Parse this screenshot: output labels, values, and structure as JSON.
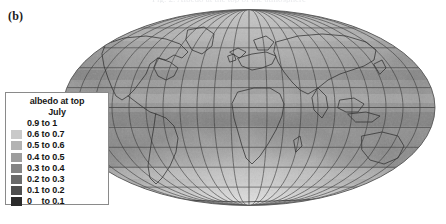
{
  "figure": {
    "panel_label": "(b)",
    "top_caption_sliver": "Fig. 2.  Albedo at the top of the atmosphere",
    "background_color": "#ffffff"
  },
  "legend": {
    "title": "albedo at top",
    "subtitle": "July",
    "border_color": "#8a8a8a",
    "background_color": "#ffffff",
    "entries": [
      {
        "label": "0.9 to 1",
        "color": "#ffffff",
        "has_swatch": false,
        "vmin": 0.9,
        "vmax": 1.0
      },
      {
        "label": "0.6 to 0.7",
        "color": "#c9c9c9",
        "has_swatch": true,
        "vmin": 0.6,
        "vmax": 0.7
      },
      {
        "label": "0.5 to 0.6",
        "color": "#b3b3b3",
        "has_swatch": true,
        "vmin": 0.5,
        "vmax": 0.6
      },
      {
        "label": "0.4 to 0.5",
        "color": "#9d9d9d",
        "has_swatch": true,
        "vmin": 0.4,
        "vmax": 0.5
      },
      {
        "label": "0.3 to 0.4",
        "color": "#848484",
        "has_swatch": true,
        "vmin": 0.3,
        "vmax": 0.4
      },
      {
        "label": "0.2 to 0.3",
        "color": "#6a6a6a",
        "has_swatch": true,
        "vmin": 0.2,
        "vmax": 0.3
      },
      {
        "label": "0.1 to 0.2",
        "color": "#4e4e4e",
        "has_swatch": true,
        "vmin": 0.1,
        "vmax": 0.2
      },
      {
        "label": "0    to 0.1",
        "color": "#2b2b2b",
        "has_swatch": true,
        "vmin": 0.0,
        "vmax": 0.1
      }
    ]
  },
  "chart_data": {
    "type": "heatmap",
    "title": "albedo at top",
    "subtitle": "July",
    "projection": "mollweide",
    "variable": "albedo at top of atmosphere",
    "units": "dimensionless (fraction 0-1)",
    "month": "July",
    "colormap": "grayscale-reversed",
    "value_range": [
      0,
      1
    ],
    "legend_position": "left-inset",
    "grid": true,
    "graticule": {
      "meridian_spacing_deg": 20,
      "parallel_spacing_deg": 20,
      "central_meridian_deg": 0,
      "line_color": "#3a3a3a"
    },
    "xlabel": "longitude",
    "ylabel": "latitude",
    "xlim": [
      -180,
      180
    ],
    "ylim": [
      -90,
      90
    ],
    "coastlines": true,
    "class_bins": [
      {
        "range": [
          0.9,
          1.0
        ],
        "color": "#ffffff",
        "label": "0.9 to 1"
      },
      {
        "range": [
          0.6,
          0.7
        ],
        "color": "#c9c9c9",
        "label": "0.6 to 0.7"
      },
      {
        "range": [
          0.5,
          0.6
        ],
        "color": "#b3b3b3",
        "label": "0.5 to 0.6"
      },
      {
        "range": [
          0.4,
          0.5
        ],
        "color": "#9d9d9d",
        "label": "0.4 to 0.5"
      },
      {
        "range": [
          0.3,
          0.4
        ],
        "color": "#848484",
        "label": "0.3 to 0.4"
      },
      {
        "range": [
          0.2,
          0.3
        ],
        "color": "#6a6a6a",
        "label": "0.2 to 0.3"
      },
      {
        "range": [
          0.1,
          0.2
        ],
        "color": "#4e4e4e",
        "label": "0.1 to 0.2"
      },
      {
        "range": [
          0.0,
          0.1
        ],
        "color": "#2b2b2b",
        "label": "0    to 0.1"
      }
    ],
    "regional_values": [
      {
        "region": "Arctic / north polar",
        "lat": 80,
        "lon": 0,
        "value": 0.55
      },
      {
        "region": "Greenland",
        "lat": 72,
        "lon": -40,
        "value": 0.62
      },
      {
        "region": "Northern Canada",
        "lat": 62,
        "lon": -100,
        "value": 0.38
      },
      {
        "region": "Siberia",
        "lat": 62,
        "lon": 100,
        "value": 0.36
      },
      {
        "region": "North Atlantic storm track",
        "lat": 52,
        "lon": -30,
        "value": 0.45
      },
      {
        "region": "North Pacific storm track",
        "lat": 48,
        "lon": -170,
        "value": 0.46
      },
      {
        "region": "Europe",
        "lat": 48,
        "lon": 12,
        "value": 0.33
      },
      {
        "region": "United States",
        "lat": 38,
        "lon": -98,
        "value": 0.3
      },
      {
        "region": "Sahara desert",
        "lat": 22,
        "lon": 12,
        "value": 0.35
      },
      {
        "region": "Arabian peninsula",
        "lat": 23,
        "lon": 45,
        "value": 0.34
      },
      {
        "region": "Indian monsoon",
        "lat": 18,
        "lon": 80,
        "value": 0.42
      },
      {
        "region": "ITCZ west Pacific",
        "lat": 8,
        "lon": 150,
        "value": 0.44
      },
      {
        "region": "Amazon basin",
        "lat": -4,
        "lon": -62,
        "value": 0.3
      },
      {
        "region": "Equatorial east Pacific",
        "lat": 0,
        "lon": -120,
        "value": 0.22
      },
      {
        "region": "Subtropical Atlantic",
        "lat": -20,
        "lon": -25,
        "value": 0.2
      },
      {
        "region": "Southern Africa",
        "lat": -22,
        "lon": 24,
        "value": 0.26
      },
      {
        "region": "Australia",
        "lat": -25,
        "lon": 134,
        "value": 0.28
      },
      {
        "region": "Southern Ocean",
        "lat": -55,
        "lon": 0,
        "value": 0.48
      },
      {
        "region": "Antarctica",
        "lat": -82,
        "lon": 0,
        "value": 0.72
      }
    ]
  }
}
